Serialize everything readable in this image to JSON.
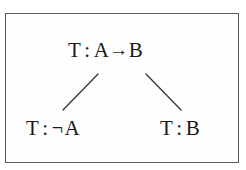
{
  "diagram": {
    "title_visible": false,
    "frame": {
      "border_color": "#5a5a5a",
      "background_color": "#fefefe"
    },
    "text_color": "#1a1a1a",
    "nodes": [
      {
        "id": "root",
        "label": "T : A→B",
        "sign": "T",
        "colon": ":",
        "formula": "A→B",
        "operand_left": "A",
        "connective": "→",
        "operand_right": "B"
      },
      {
        "id": "left-child",
        "label": "T : ¬A",
        "sign": "T",
        "colon": ":",
        "formula": "¬A",
        "negation": "¬",
        "operand": "A"
      },
      {
        "id": "right-child",
        "label": "T : B",
        "sign": "T",
        "colon": ":",
        "formula": "B",
        "operand": "B"
      }
    ],
    "edges": [
      {
        "id": "root-to-left",
        "from": "root",
        "to": "left-child",
        "x1": 98,
        "y1": 74,
        "x2": 63,
        "y2": 110,
        "color": "#3c3c3c"
      },
      {
        "id": "root-to-right",
        "from": "root",
        "to": "right-child",
        "x1": 146,
        "y1": 74,
        "x2": 181,
        "y2": 110,
        "color": "#3c3c3c"
      }
    ]
  }
}
